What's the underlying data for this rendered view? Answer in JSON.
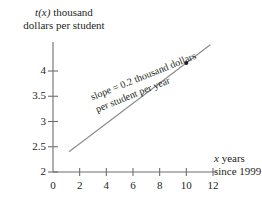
{
  "chart_data": {
    "type": "line",
    "title": "",
    "xlabel": "x years since 1999",
    "ylabel": "t(x) thousand dollars per student",
    "xlim": [
      0,
      12
    ],
    "ylim": [
      2,
      4.6
    ],
    "xticks": [
      0,
      2,
      4,
      6,
      8,
      10,
      12
    ],
    "xtick_labels": [
      "0",
      "2",
      "4",
      "6",
      "8",
      "10",
      "12"
    ],
    "yticks": [
      2,
      2.5,
      3,
      3.5,
      4
    ],
    "ytick_labels": [
      "2",
      "2.5",
      "3",
      "3.5",
      "4"
    ],
    "grid": false,
    "legend": "none",
    "series": [
      {
        "name": "t(x)",
        "slope": 0.2,
        "intercept": 2.16,
        "x": [
          1.2,
          11.8
        ],
        "values": [
          2.4,
          4.52
        ],
        "color": "#8a8a8a"
      }
    ],
    "points": [
      {
        "x": 10,
        "y": 4.16,
        "color": "#231f20"
      }
    ],
    "annotations": [
      {
        "text_line1": "slope = 0.2 thousand dollars",
        "text_line2": "per student per year",
        "rotation_deg": -22,
        "color": "#231f20"
      }
    ]
  },
  "axes": {
    "y_label_line1_pre": "t",
    "y_label_line1_var": "(x)",
    "y_label_line1_post": " thousand",
    "y_label_line2": "dollars per student",
    "x_label_line1_var": "x",
    "x_label_line1_post": " years",
    "x_label_line2": "since 1999"
  },
  "colors": {
    "line": "#8a8a8a",
    "axis": "#6e6e6e",
    "text": "#231f20",
    "background": "#ffffff",
    "point": "#231f20"
  }
}
